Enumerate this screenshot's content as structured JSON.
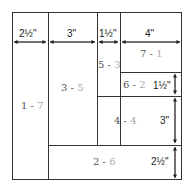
{
  "pieces": [
    {
      "id": "p1",
      "a": "1",
      "b": "7"
    },
    {
      "id": "p2",
      "a": "3",
      "b": "5"
    },
    {
      "id": "p3",
      "a": "5",
      "b": "3"
    },
    {
      "id": "p4",
      "a": "7",
      "b": "1"
    },
    {
      "id": "p5",
      "a": "6",
      "b": "2"
    },
    {
      "id": "p6",
      "a": "4",
      "b": "4"
    },
    {
      "id": "p7",
      "a": "2",
      "b": "6"
    }
  ],
  "separator": " - ",
  "dimensions": {
    "w1": "2½\"",
    "w2": "3\"",
    "w3": "1½\"",
    "w4": "4\"",
    "h1": "1½\"",
    "h2": "3\"",
    "h3": "2½\""
  }
}
